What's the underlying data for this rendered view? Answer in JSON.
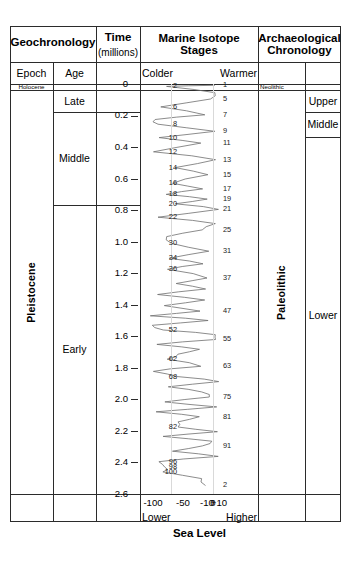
{
  "columns": {
    "geochronology": {
      "title": "Geochronology",
      "sub_epoch": "Epoch",
      "sub_age": "Age",
      "epochs": [
        {
          "label": "Holocene",
          "style": "tiny"
        },
        {
          "label": "Pleistocene",
          "style": "rotated"
        }
      ],
      "ages": [
        {
          "label": "Late"
        },
        {
          "label": "Middle"
        },
        {
          "label": "Early"
        }
      ]
    },
    "time": {
      "title": "Time",
      "subtitle": "(millions)",
      "ticks": [
        "0",
        "0.2",
        "0.4",
        "0.6",
        "0.8",
        "1.0",
        "1.2",
        "1.4",
        "1.6",
        "1.8",
        "2.0",
        "2.2",
        "2.4",
        "2.6"
      ]
    },
    "marine": {
      "title": "Marine Isotope\nStages",
      "left_label": "Colder",
      "right_label": "Warmer",
      "axis_ticks": [
        "-100",
        "-50",
        "-10",
        "0",
        "+10"
      ],
      "axis_left_label": "Lower",
      "axis_right_label": "Higher",
      "axis_title": "Sea Level"
    },
    "archaeology": {
      "title": "Archaeological\nChronology",
      "periods": [
        {
          "label": "Neolithic",
          "style": "tiny"
        },
        {
          "label": "Paleolithic",
          "style": "rotated"
        }
      ],
      "subdivisions": [
        {
          "label": "Upper"
        },
        {
          "label": "Middle"
        },
        {
          "label": "Lower"
        }
      ]
    }
  },
  "chart_data": {
    "type": "line",
    "title": "Marine Isotope Stages",
    "xlabel": "Sea Level",
    "ylabel": "Time (millions)",
    "xlim": [
      -110,
      15
    ],
    "ylim": [
      0,
      2.6
    ],
    "grid": true,
    "legend": "none",
    "orientation": "vertical-time-axis",
    "x_ticks": [
      -100,
      -50,
      -10,
      0,
      10
    ],
    "x_tick_labels": [
      "-100",
      "-50",
      "-10",
      "0",
      "+10"
    ],
    "x_direction_labels": {
      "left": "Lower / Colder",
      "right": "Higher / Warmer"
    },
    "y_ticks": [
      0,
      0.2,
      0.4,
      0.6,
      0.8,
      1.0,
      1.2,
      1.4,
      1.6,
      1.8,
      2.0,
      2.2,
      2.4,
      2.6
    ],
    "annotations_left_colder": [
      {
        "stage": "2",
        "age": 0.015
      },
      {
        "stage": "6",
        "age": 0.145
      },
      {
        "stage": "8",
        "age": 0.255
      },
      {
        "stage": "10",
        "age": 0.34
      },
      {
        "stage": "12",
        "age": 0.43
      },
      {
        "stage": "14",
        "age": 0.53
      },
      {
        "stage": "16",
        "age": 0.63
      },
      {
        "stage": "18",
        "age": 0.7
      },
      {
        "stage": "20",
        "age": 0.76
      },
      {
        "stage": "22",
        "age": 0.845
      },
      {
        "stage": "30",
        "age": 1.01
      },
      {
        "stage": "34",
        "age": 1.105
      },
      {
        "stage": "36",
        "age": 1.175
      },
      {
        "stage": "52",
        "age": 1.56
      },
      {
        "stage": "62",
        "age": 1.745
      },
      {
        "stage": "68",
        "age": 1.855
      },
      {
        "stage": "82",
        "age": 2.175
      },
      {
        "stage": "96",
        "age": 2.395
      },
      {
        "stage": "98",
        "age": 2.43
      },
      {
        "stage": "100",
        "age": 2.46
      }
    ],
    "annotations_right_warmer": [
      {
        "stage": "1",
        "age": 0.008
      },
      {
        "stage": "5",
        "age": 0.095
      },
      {
        "stage": "7",
        "age": 0.195
      },
      {
        "stage": "9",
        "age": 0.3
      },
      {
        "stage": "11",
        "age": 0.375
      },
      {
        "stage": "13",
        "age": 0.48
      },
      {
        "stage": "15",
        "age": 0.575
      },
      {
        "stage": "17",
        "age": 0.665
      },
      {
        "stage": "19",
        "age": 0.73
      },
      {
        "stage": "21",
        "age": 0.795
      },
      {
        "stage": "25",
        "age": 0.925
      },
      {
        "stage": "31",
        "age": 1.06
      },
      {
        "stage": "37",
        "age": 1.23
      },
      {
        "stage": "47",
        "age": 1.44
      },
      {
        "stage": "55",
        "age": 1.62
      },
      {
        "stage": "63",
        "age": 1.79
      },
      {
        "stage": "75",
        "age": 1.985
      },
      {
        "stage": "81",
        "age": 2.11
      },
      {
        "stage": "91",
        "age": 2.295
      },
      {
        "stage": "2",
        "age": 2.545
      }
    ]
  },
  "colors": {
    "border": "#2b2b2b",
    "curve": "#6e6e6e",
    "grid": "#d9d9d9",
    "text": "#000000"
  }
}
